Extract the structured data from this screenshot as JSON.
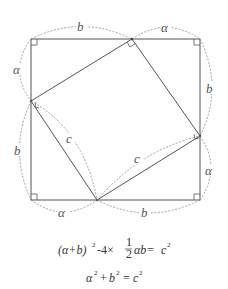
{
  "diagram": {
    "outer_square": {
      "x1": 31,
      "y1": 39,
      "x2": 200,
      "y2": 200
    },
    "inner_square_points": [
      [
        132,
        39
      ],
      [
        200,
        136
      ],
      [
        97,
        200
      ],
      [
        31,
        101
      ]
    ],
    "labels": {
      "top_left": "b",
      "top_right": "α",
      "right_top": "b",
      "right_bottom": "α",
      "bottom_left": "α",
      "bottom_right": "b",
      "left_top": "α",
      "left_bottom": "b",
      "hyp_left": "c",
      "hyp_bottom": "c"
    },
    "colors": {
      "line": "#555555",
      "dash": "#888888",
      "text": "#444444"
    }
  },
  "formulas": {
    "line1": {
      "open": "(α+b)",
      "exp1": "2",
      "minus": "-4×",
      "frac_num": "1",
      "frac_den": "2",
      "ab": "αb=",
      "c": "c",
      "exp2": "2"
    },
    "line2": {
      "a": "α",
      "exp_a": "2",
      "plus": "+",
      "b": "b",
      "exp_b": "2",
      "eq": "=",
      "c": "c",
      "exp_c": "2"
    }
  }
}
